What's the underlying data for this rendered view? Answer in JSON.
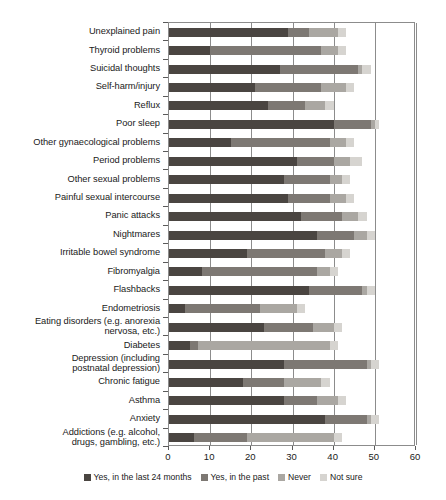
{
  "chart_data": {
    "type": "bar",
    "orientation": "horizontal",
    "stacked": true,
    "title": "",
    "subtitle": "",
    "xlabel": "",
    "ylabel": "",
    "xlim": [
      0,
      60
    ],
    "xticks": [
      0,
      10,
      20,
      30,
      40,
      50,
      60
    ],
    "xtick_labels": [
      "0",
      "10",
      "20",
      "30",
      "40",
      "50",
      "60"
    ],
    "grid": "vertical",
    "legend_position": "bottom",
    "legend": [
      "Yes, in the last 24 months",
      "Yes, in the past",
      "Never",
      "Not sure"
    ],
    "colors": [
      "#4a4541",
      "#7d7873",
      "#aaa7a2",
      "#d6d4d0"
    ],
    "categories": [
      "Unexplained pain",
      "Thyroid problems",
      "Suicidal thoughts",
      "Self-harm/injury",
      "Reflux",
      "Poor sleep",
      "Other gynaecological problems",
      "Period problems",
      "Other sexual problems",
      "Painful sexual intercourse",
      "Panic attacks",
      "Nightmares",
      "Irritable bowel syndrome",
      "Fibromyalgia",
      "Flashbacks",
      "Endometriosis",
      "Eating disorders (e.g. anorexia\nnervosa, etc.)",
      "Diabetes",
      "Depression (including\npostnatal depression)",
      "Chronic fatigue",
      "Asthma",
      "Anxiety",
      "Addictions (e.g. alcohol,\ndrugs, gambling, etc.)"
    ],
    "series": [
      {
        "name": "Yes, in the last 24 months",
        "color": "#4a4541",
        "values": [
          29,
          10,
          27,
          21,
          24,
          40,
          15,
          31,
          28,
          29,
          32,
          36,
          19,
          8,
          34,
          4,
          23,
          5,
          28,
          18,
          28,
          38,
          6
        ]
      },
      {
        "name": "Yes, in the past",
        "color": "#7d7873",
        "values": [
          5,
          27,
          19,
          16,
          9,
          9,
          24,
          9,
          11,
          10,
          10,
          9,
          19,
          28,
          13,
          18,
          12,
          2,
          20,
          10,
          8,
          10,
          13
        ]
      },
      {
        "name": "Never",
        "color": "#aaa7a2",
        "values": [
          7,
          4,
          1,
          6,
          5,
          1,
          4,
          4,
          3,
          4,
          4,
          3,
          4,
          3,
          1,
          9,
          5,
          32,
          1,
          9,
          5,
          1,
          21
        ]
      },
      {
        "name": "Not sure",
        "color": "#d6d4d0",
        "values": [
          2,
          2,
          2,
          2,
          2,
          1,
          2,
          3,
          2,
          2,
          2,
          2,
          2,
          2,
          2,
          2,
          2,
          2,
          2,
          2,
          2,
          2,
          2
        ]
      }
    ]
  },
  "axis": {
    "x_min": 0,
    "x_max": 60
  }
}
